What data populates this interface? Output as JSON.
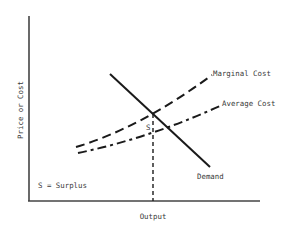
{
  "diagram": {
    "y_axis_label": "Price or Cost",
    "x_axis_label": "Output",
    "legend_note": "S = Surplus",
    "surplus_marker": "S",
    "curves": [
      {
        "name": "Marginal Cost",
        "style": "dashed",
        "label": "Marginal Cost"
      },
      {
        "name": "Average Cost",
        "style": "dash-dot",
        "label": "Average Cost"
      },
      {
        "name": "Demand",
        "style": "solid",
        "label": "Demand"
      }
    ],
    "colors": {
      "line": "#1a1a1a",
      "axis": "#444444",
      "text": "#3a3a3a",
      "background": "#ffffff"
    }
  }
}
